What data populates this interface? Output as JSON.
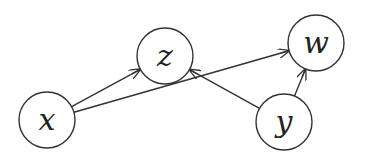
{
  "diagram": {
    "type": "directed-graph",
    "stroke_color": "#333333",
    "background": "#ffffff",
    "nodes": [
      {
        "id": "x",
        "label": "x",
        "cx": 47,
        "cy": 120,
        "r": 28
      },
      {
        "id": "z",
        "label": "z",
        "cx": 165,
        "cy": 56,
        "r": 28
      },
      {
        "id": "w",
        "label": "w",
        "cx": 316,
        "cy": 43,
        "r": 28
      },
      {
        "id": "y",
        "label": "y",
        "cx": 284,
        "cy": 122,
        "r": 28
      }
    ],
    "edges": [
      {
        "from": "x",
        "to": "z"
      },
      {
        "from": "x",
        "to": "w"
      },
      {
        "from": "y",
        "to": "z"
      },
      {
        "from": "y",
        "to": "w"
      }
    ]
  }
}
